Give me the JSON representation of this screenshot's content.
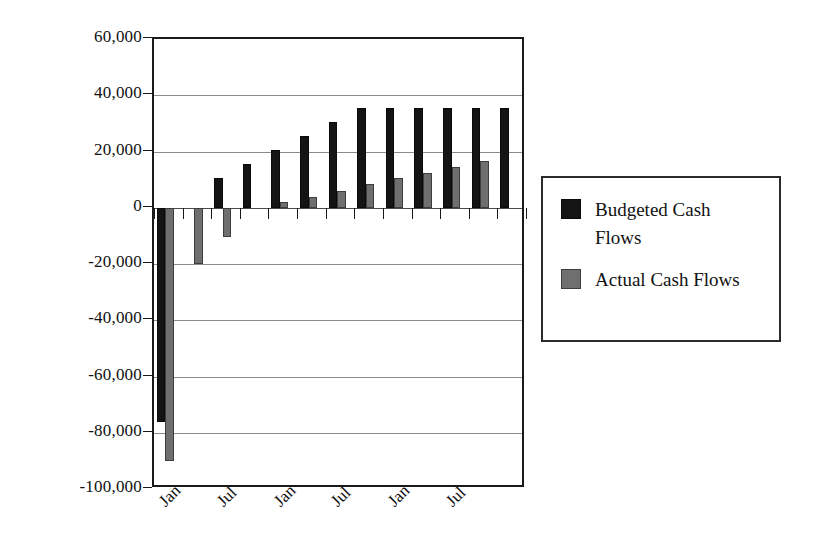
{
  "chart_data": {
    "type": "bar",
    "title": "",
    "subtitle": "",
    "xlabel": "",
    "ylabel": "",
    "ylim": [
      -100000,
      60000
    ],
    "ytick_step": 20000,
    "grid": true,
    "legend_position": "right",
    "orientation": "vertical",
    "bar_mode": "grouped",
    "categories": [
      "Jan",
      "",
      "Jul",
      "",
      "Jan",
      "",
      "Jul",
      "",
      "Jan",
      "",
      "Jul",
      "",
      ""
    ],
    "tick_labels": [
      {
        "index": 0,
        "text": "Jan"
      },
      {
        "index": 2,
        "text": "Jul"
      },
      {
        "index": 4,
        "text": "Jan"
      },
      {
        "index": 6,
        "text": "Jul"
      },
      {
        "index": 8,
        "text": "Jan"
      },
      {
        "index": 10,
        "text": "Jul"
      }
    ],
    "ytick_labels": [
      "60,000",
      "40,000",
      "20,000",
      "0",
      "-20,000",
      "-40,000",
      "-60,000",
      "-80,000",
      "-100,000"
    ],
    "ytick_values": [
      60000,
      40000,
      20000,
      0,
      -20000,
      -40000,
      -60000,
      -80000,
      -100000
    ],
    "series": [
      {
        "name": "Budgeted Cash Flows",
        "color": "#141414",
        "values": [
          -76000,
          0,
          10500,
          15500,
          20500,
          25500,
          30500,
          35500,
          35500,
          35500,
          35500,
          35500,
          35500
        ]
      },
      {
        "name": "Actual Cash Flows",
        "color": "#6f6f6f",
        "values": [
          -90000,
          -20000,
          -10500,
          0,
          2000,
          4000,
          6000,
          8500,
          10500,
          12500,
          14500,
          16500,
          0
        ]
      }
    ]
  },
  "legend": {
    "entries": [
      {
        "label": "Budgeted Cash Flows",
        "color": "#141414",
        "swatch": "budgeted"
      },
      {
        "label": "Actual Cash Flows",
        "color": "#6f6f6f",
        "swatch": "actual"
      }
    ]
  }
}
